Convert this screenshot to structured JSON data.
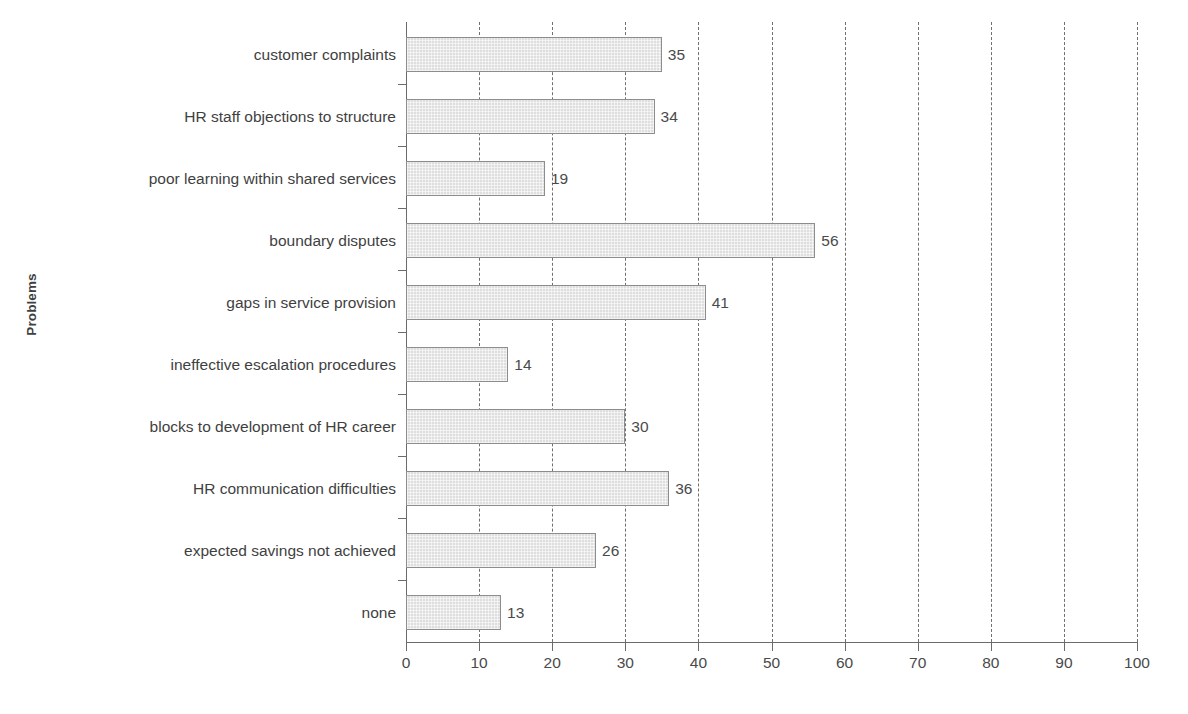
{
  "chart_data": {
    "type": "bar",
    "orientation": "horizontal",
    "title": "",
    "xlabel": "",
    "ylabel": "Problems",
    "xlim": [
      0,
      100
    ],
    "xticks": [
      0,
      10,
      20,
      30,
      40,
      50,
      60,
      70,
      80,
      90,
      100
    ],
    "xtick_labels": [
      "0",
      "10",
      "20",
      "30",
      "40",
      "50",
      "60",
      "70",
      "80",
      "90",
      "100"
    ],
    "grid": "vertical-dashed",
    "legend": "none",
    "bar_fill_color": "#dedede",
    "bar_edge_color": "#8d8d8d",
    "categories": [
      "customer complaints",
      "HR staff objections to structure",
      "poor learning within shared services",
      "boundary disputes",
      "gaps in service provision",
      "ineffective escalation procedures",
      "blocks to development of HR career",
      "HR communication difficulties",
      "expected savings not achieved",
      "none"
    ],
    "values": [
      35,
      34,
      19,
      56,
      41,
      14,
      30,
      36,
      26,
      13
    ],
    "value_labels": [
      "35",
      "34",
      "19",
      "56",
      "41",
      "14",
      "30",
      "36",
      "26",
      "13"
    ]
  }
}
